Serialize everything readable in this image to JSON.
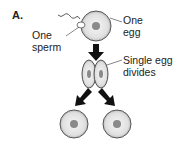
{
  "panel_label": "A.",
  "labels": {
    "egg_line1": "One",
    "egg_line2": "egg",
    "sperm_line1": "One",
    "sperm_line2": "sperm",
    "divide_line1": "Single egg",
    "divide_line2": "divides"
  },
  "colors": {
    "cell_fill": "#e4e4e4",
    "cell_stroke": "#555555",
    "nucleus": "#8a8a8a",
    "arrow": "#111111"
  }
}
